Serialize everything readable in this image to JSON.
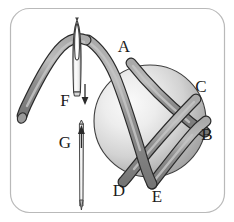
{
  "figure": {
    "frame": {
      "stroke_color": "#b9b9b9",
      "corner_radius": 18,
      "background": "#ffffff"
    },
    "colors": {
      "thread_fill": "#8d8d8d",
      "thread_highlight": "#b5b5b5",
      "thread_outline": "#2a2a2a",
      "bead_light": "#f2f2f2",
      "bead_mid": "#cfcfcf",
      "bead_dark": "#9a9a9a",
      "bead_outline": "#3a3a3a",
      "needle_fill": "#fbfbfb",
      "needle_outline": "#3a3a3a",
      "label_color": "#1b1b1b"
    },
    "labels": [
      {
        "id": "A",
        "text": "A",
        "x": 124,
        "y": 52
      },
      {
        "id": "B",
        "text": "B",
        "x": 205,
        "y": 138
      },
      {
        "id": "C",
        "text": "C",
        "x": 200,
        "y": 92
      },
      {
        "id": "D",
        "text": "D",
        "x": 119,
        "y": 194
      },
      {
        "id": "E",
        "text": "E",
        "x": 156,
        "y": 200
      },
      {
        "id": "F",
        "text": "F",
        "x": 63,
        "y": 105
      },
      {
        "id": "G",
        "text": "G",
        "x": 63,
        "y": 147
      }
    ],
    "arrows": [
      {
        "id": "F",
        "direction": "down",
        "x": 85,
        "y_start": 84,
        "y_end": 104
      },
      {
        "id": "G",
        "direction": "up",
        "x": 81,
        "y_start": 146,
        "y_end": 126
      }
    ],
    "parts": {
      "upper_needle": "threaded-needle-pointing-down",
      "lower_needle": "bare-needle-pointing-up",
      "bead": "sphere",
      "thread": "wrapped-thread-loops"
    }
  }
}
